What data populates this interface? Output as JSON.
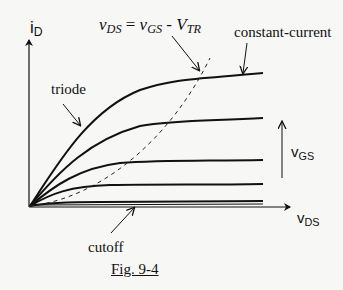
{
  "diagram": {
    "caption": "Fig. 9-4",
    "axes": {
      "y_label_main": "i",
      "y_label_sub": "D",
      "x_label_main": "v",
      "x_label_sub": "DS"
    },
    "annotations": {
      "equation": {
        "lhs_main": "v",
        "lhs_sub": "DS",
        "eq": " = ",
        "r1_main": "v",
        "r1_sub": "GS",
        "minus": " - ",
        "r2_main": "V",
        "r2_sub": "TR"
      },
      "constant_current": "constant-current",
      "triode": "triode",
      "cutoff": "cutoff",
      "vgs_main": "v",
      "vgs_sub": "GS"
    },
    "curves": {
      "count": 5,
      "saturation_levels_px": [
        73,
        118,
        160,
        184,
        201
      ],
      "boundary": "dashed parabola v_DS = v_GS - V_TR"
    },
    "colors": {
      "ink": "#111111",
      "background": "#f7f7f5"
    }
  }
}
